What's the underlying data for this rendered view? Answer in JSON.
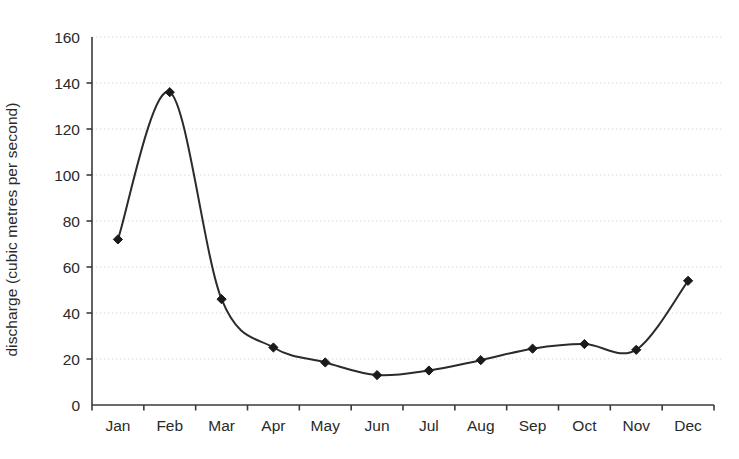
{
  "chart_data": {
    "type": "line",
    "title": "",
    "subtitle": "",
    "xlabel": "",
    "ylabel": "discharge (cubic metres per second)",
    "categories": [
      "Jan",
      "Feb",
      "Mar",
      "Apr",
      "May",
      "Jun",
      "Jul",
      "Aug",
      "Sep",
      "Oct",
      "Nov",
      "Dec"
    ],
    "values": [
      72,
      136,
      46,
      25,
      18.5,
      13,
      15,
      19.5,
      24.5,
      26.5,
      24,
      54
    ],
    "series": [
      {
        "name": "discharge",
        "values": [
          72,
          136,
          46,
          25,
          18.5,
          13,
          15,
          19.5,
          24.5,
          26.5,
          24,
          54
        ]
      }
    ],
    "ylim": [
      0,
      160
    ],
    "ytick_labels": [
      "0",
      "20",
      "40",
      "60",
      "80",
      "100",
      "120",
      "140",
      "160"
    ],
    "ytick_values": [
      0,
      20,
      40,
      60,
      80,
      100,
      120,
      140,
      160
    ],
    "xtick_labels": [
      "Jan",
      "Feb",
      "Mar",
      "Apr",
      "May",
      "Jun",
      "Jul",
      "Aug",
      "Sep",
      "Oct",
      "Nov",
      "Dec"
    ],
    "grid": true,
    "grid_axis": "y",
    "grid_style": "dotted",
    "legend": false,
    "legend_position": "none",
    "marker": "diamond",
    "line_color": "#2b2b2b",
    "marker_color": "#1a1a1a",
    "grid_color": "#d8d8d8",
    "axis_color": "#3a3a3a",
    "background_color": "#ffffff",
    "smoothing": "spline"
  },
  "axes": {
    "y_title": "discharge (cubic metres per second)",
    "y_ticks": [
      {
        "label": "160",
        "value": 160
      },
      {
        "label": "140",
        "value": 140
      },
      {
        "label": "120",
        "value": 120
      },
      {
        "label": "100",
        "value": 100
      },
      {
        "label": "80",
        "value": 80
      },
      {
        "label": "60",
        "value": 60
      },
      {
        "label": "40",
        "value": 40
      },
      {
        "label": "20",
        "value": 20
      },
      {
        "label": "0",
        "value": 0
      }
    ],
    "x_ticks": [
      {
        "label": "Jan"
      },
      {
        "label": "Feb"
      },
      {
        "label": "Mar"
      },
      {
        "label": "Apr"
      },
      {
        "label": "May"
      },
      {
        "label": "Jun"
      },
      {
        "label": "Jul"
      },
      {
        "label": "Aug"
      },
      {
        "label": "Sep"
      },
      {
        "label": "Oct"
      },
      {
        "label": "Nov"
      },
      {
        "label": "Dec"
      }
    ]
  },
  "points": [
    {
      "label": "Jan",
      "value": 72
    },
    {
      "label": "Feb",
      "value": 136
    },
    {
      "label": "Mar",
      "value": 46
    },
    {
      "label": "Apr",
      "value": 25
    },
    {
      "label": "May",
      "value": 18.5
    },
    {
      "label": "Jun",
      "value": 13
    },
    {
      "label": "Jul",
      "value": 15
    },
    {
      "label": "Aug",
      "value": 19.5
    },
    {
      "label": "Sep",
      "value": 24.5
    },
    {
      "label": "Oct",
      "value": 26.5
    },
    {
      "label": "Nov",
      "value": 24
    },
    {
      "label": "Dec",
      "value": 54
    }
  ]
}
